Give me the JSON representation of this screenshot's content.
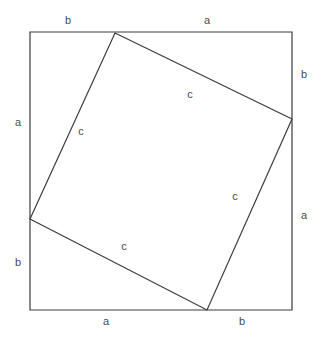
{
  "figure": {
    "background_color": "#ffffff",
    "stroke_color": "#3c3c3c",
    "label_color": "#4a4a4a",
    "outer_square": {
      "name": "outer-square",
      "stroke_width": 1.2,
      "points": "30,32 292,32 292,310 30,310",
      "corners": {
        "top_left": [
          30,
          32
        ],
        "top_right": [
          292,
          32
        ],
        "bottom_right": [
          292,
          310
        ],
        "bottom_left": [
          30,
          310
        ]
      }
    },
    "inner_square": {
      "name": "inner-square-hypotenuse",
      "stroke_width": 1.2,
      "points": "115,33 292,119 207,310 30,219",
      "vertices": {
        "top": [
          115,
          33
        ],
        "right": [
          292,
          119
        ],
        "bottom": [
          207,
          310
        ],
        "left": [
          30,
          219
        ]
      }
    },
    "labels": [
      {
        "id": "label-top-b",
        "text": "b",
        "x": 68,
        "y": 21,
        "side": "top",
        "segment": "b"
      },
      {
        "id": "label-top-a",
        "text": "a",
        "x": 207,
        "y": 21,
        "side": "top",
        "segment": "a"
      },
      {
        "id": "label-right-b",
        "text": "b",
        "x": 304,
        "y": 75,
        "side": "right",
        "segment": "b"
      },
      {
        "id": "label-right-a",
        "text": "a",
        "x": 304,
        "y": 216,
        "side": "right",
        "segment": "a"
      },
      {
        "id": "label-bottom-a",
        "text": "a",
        "x": 106,
        "y": 322,
        "side": "bottom",
        "segment": "a"
      },
      {
        "id": "label-bottom-b",
        "text": "b",
        "x": 242,
        "y": 322,
        "side": "bottom",
        "segment": "b"
      },
      {
        "id": "label-left-a",
        "text": "a",
        "x": 18,
        "y": 123,
        "side": "left",
        "segment": "a"
      },
      {
        "id": "label-left-b",
        "text": "b",
        "x": 18,
        "y": 263,
        "side": "left",
        "segment": "b"
      },
      {
        "id": "label-c-topright",
        "text": "c",
        "x": 190,
        "y": 95,
        "side": "inner",
        "segment": "c"
      },
      {
        "id": "label-c-topleft",
        "text": "c",
        "x": 81,
        "y": 132,
        "side": "inner",
        "segment": "c"
      },
      {
        "id": "label-c-bottomright",
        "text": "c",
        "x": 235,
        "y": 197,
        "side": "inner",
        "segment": "c"
      },
      {
        "id": "label-c-bottomleft",
        "text": "c",
        "x": 124,
        "y": 247,
        "side": "inner",
        "segment": "c"
      }
    ]
  }
}
